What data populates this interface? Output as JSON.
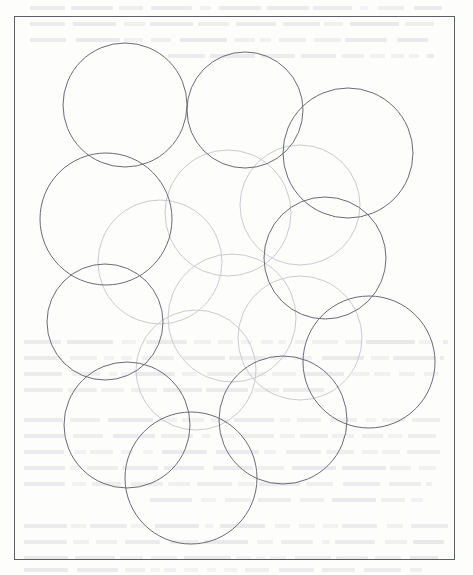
{
  "page": {
    "width": 473,
    "height": 575,
    "background_color": "#fdfdfc",
    "kind": "scanned-book-page-figure"
  },
  "frame": {
    "name": "figure-border",
    "x": 14,
    "y": 16,
    "width": 441,
    "height": 544,
    "stroke_color": "#5d5f66",
    "stroke_width": 1,
    "fill": "none"
  },
  "figure": {
    "title": "",
    "description": "Arrangement of overlapping circles of nearly equal radius covering a rectangular region",
    "stroke_dark": "#6a6c73",
    "stroke_mid": "#9a9ca2",
    "stroke_faint": "#c9cbd0",
    "stroke_width": 1
  },
  "chart_data": {
    "type": "scatter",
    "title": "",
    "xlabel": "",
    "ylabel": "",
    "grid": false,
    "legend": null,
    "xlim": [
      14,
      455
    ],
    "ylim": [
      16,
      560
    ],
    "note": "Each datum is a circle: center (cx, cy) and radius r in page pixel coordinates; tone encodes scan ink darkness.",
    "circles": [
      {
        "id": "c1",
        "label": "upper-left",
        "cx": 125,
        "cy": 105,
        "r": 62,
        "tone": "dark"
      },
      {
        "id": "c2",
        "label": "upper-center",
        "cx": 245,
        "cy": 110,
        "r": 58,
        "tone": "dark"
      },
      {
        "id": "c3",
        "label": "upper-right",
        "cx": 348,
        "cy": 153,
        "r": 65,
        "tone": "dark"
      },
      {
        "id": "c4",
        "label": "left-upper-middle",
        "cx": 106,
        "cy": 219,
        "r": 66,
        "tone": "dark"
      },
      {
        "id": "c5",
        "label": "right-middle",
        "cx": 325,
        "cy": 258,
        "r": 61,
        "tone": "dark"
      },
      {
        "id": "c6",
        "label": "lower-right",
        "cx": 369,
        "cy": 362,
        "r": 66,
        "tone": "dark"
      },
      {
        "id": "c7",
        "label": "left-lower-middle",
        "cx": 105,
        "cy": 322,
        "r": 58,
        "tone": "dark"
      },
      {
        "id": "c8",
        "label": "lower-left",
        "cx": 127,
        "cy": 425,
        "r": 63,
        "tone": "dark"
      },
      {
        "id": "c9",
        "label": "bottom-center",
        "cx": 191,
        "cy": 478,
        "r": 66,
        "tone": "dark"
      },
      {
        "id": "c10",
        "label": "lower-center-right",
        "cx": 283,
        "cy": 420,
        "r": 64,
        "tone": "dark"
      },
      {
        "id": "c11",
        "label": "center-upper",
        "cx": 228,
        "cy": 213,
        "r": 63,
        "tone": "faint"
      },
      {
        "id": "c12",
        "label": "center-left",
        "cx": 160,
        "cy": 262,
        "r": 62,
        "tone": "faint"
      },
      {
        "id": "c13",
        "label": "center-lower",
        "cx": 232,
        "cy": 318,
        "r": 64,
        "tone": "faint"
      },
      {
        "id": "c14",
        "label": "center-right-low",
        "cx": 300,
        "cy": 338,
        "r": 62,
        "tone": "faint"
      },
      {
        "id": "c15",
        "label": "center-mid",
        "cx": 196,
        "cy": 370,
        "r": 60,
        "tone": "faint"
      },
      {
        "id": "c16",
        "label": "right-upper-faint",
        "cx": 300,
        "cy": 205,
        "r": 60,
        "tone": "faint"
      }
    ]
  },
  "bleedthrough": {
    "visible": true,
    "color": "#dcdce0",
    "description": "Very faint mirrored text showing through from the reverse side of the scanned page",
    "lines": [
      {
        "x": 30,
        "y": 6,
        "w": 412
      },
      {
        "x": 30,
        "y": 22,
        "w": 404
      },
      {
        "x": 30,
        "y": 38,
        "w": 398
      },
      {
        "x": 168,
        "y": 54,
        "w": 266
      },
      {
        "x": 24,
        "y": 340,
        "w": 424
      },
      {
        "x": 24,
        "y": 356,
        "w": 420
      },
      {
        "x": 24,
        "y": 372,
        "w": 416
      },
      {
        "x": 24,
        "y": 388,
        "w": 300
      },
      {
        "x": 24,
        "y": 418,
        "w": 424
      },
      {
        "x": 24,
        "y": 434,
        "w": 416
      },
      {
        "x": 24,
        "y": 450,
        "w": 420
      },
      {
        "x": 24,
        "y": 466,
        "w": 412
      },
      {
        "x": 24,
        "y": 482,
        "w": 408
      },
      {
        "x": 150,
        "y": 498,
        "w": 282
      },
      {
        "x": 24,
        "y": 524,
        "w": 428
      },
      {
        "x": 24,
        "y": 540,
        "w": 420
      },
      {
        "x": 24,
        "y": 556,
        "w": 414
      },
      {
        "x": 24,
        "y": 568,
        "w": 398
      }
    ]
  }
}
